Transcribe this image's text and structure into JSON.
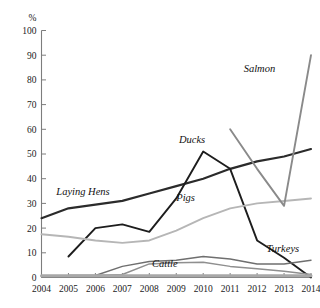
{
  "chart_data": {
    "type": "line",
    "title": "",
    "xlabel": "",
    "ylabel": "%",
    "ylim": [
      0,
      100
    ],
    "ytick_step": 10,
    "grid": false,
    "legend_position": "inline-labels",
    "categories": [
      "2004",
      "2005",
      "2006",
      "2007",
      "2008",
      "2009",
      "2010",
      "2011",
      "2012",
      "2013",
      "2014"
    ],
    "yticks": [
      "0",
      "10",
      "20",
      "30",
      "40",
      "50",
      "60",
      "70",
      "80",
      "90",
      "100"
    ],
    "series": [
      {
        "name": "Laying Hens",
        "color": "#2b2b2b",
        "width": 2.2,
        "label_x": 2004.55,
        "label_y": 33.5,
        "x": [
          2004,
          2005,
          2006,
          2007,
          2008,
          2009,
          2010,
          2011,
          2012,
          2013,
          2014
        ],
        "values": [
          24,
          28,
          29.5,
          31,
          34,
          37,
          40,
          44,
          47,
          49,
          52
        ]
      },
      {
        "name": "Ducks",
        "color": "#1d1d1d",
        "width": 1.9,
        "label_x": 2009.1,
        "label_y": 54.5,
        "x": [
          2005,
          2006,
          2007,
          2008,
          2009,
          2010,
          2011,
          2012,
          2013,
          2014
        ],
        "values": [
          8.5,
          20,
          21.5,
          18.5,
          32,
          51,
          44,
          15,
          8,
          0
        ]
      },
      {
        "name": "Pigs",
        "color": "#b6b6b6",
        "width": 1.9,
        "label_x": 2009.0,
        "label_y": 31.0,
        "x": [
          2004,
          2005,
          2006,
          2007,
          2008,
          2009,
          2010,
          2011,
          2012,
          2013,
          2014
        ],
        "values": [
          17.5,
          16.5,
          15,
          14,
          15,
          19,
          24,
          28,
          30,
          31,
          32
        ]
      },
      {
        "name": "Salmon",
        "color": "#8a8a8a",
        "width": 1.9,
        "label_x": 2011.5,
        "label_y": 83.0,
        "x": [
          2011,
          2012,
          2013,
          2014
        ],
        "values": [
          60,
          44,
          29,
          90
        ]
      },
      {
        "name": "Turkeys",
        "color": "#6f6f6f",
        "width": 1.5,
        "label_x": 2012.35,
        "label_y": 10.5,
        "x": [
          2005,
          2006,
          2007,
          2008,
          2009,
          2010,
          2011,
          2012,
          2013,
          2014
        ],
        "values": [
          0.8,
          0.8,
          4.5,
          6.5,
          7,
          8.5,
          7.5,
          5.5,
          5.5,
          7
        ]
      },
      {
        "name": "Cattle",
        "color": "#8f8f8f",
        "width": 1.5,
        "label_x": 2008.1,
        "label_y": 4.2,
        "x": [
          2005,
          2006,
          2007,
          2008,
          2009,
          2010,
          2011,
          2012,
          2013,
          2014
        ],
        "values": [
          0.8,
          0.8,
          1.2,
          5.5,
          6,
          6.2,
          4.5,
          3.5,
          2.5,
          1.2
        ]
      },
      {
        "name": "Baseline",
        "color": "#a8a8a8",
        "width": 3.0,
        "label_x": null,
        "label_y": null,
        "x": [
          2004,
          2005,
          2006,
          2007,
          2008,
          2009,
          2010,
          2011,
          2012,
          2013,
          2014
        ],
        "values": [
          0.7,
          0.7,
          0.7,
          0.7,
          0.7,
          0.7,
          0.7,
          0.7,
          0.7,
          0.7,
          0.7
        ]
      }
    ]
  }
}
